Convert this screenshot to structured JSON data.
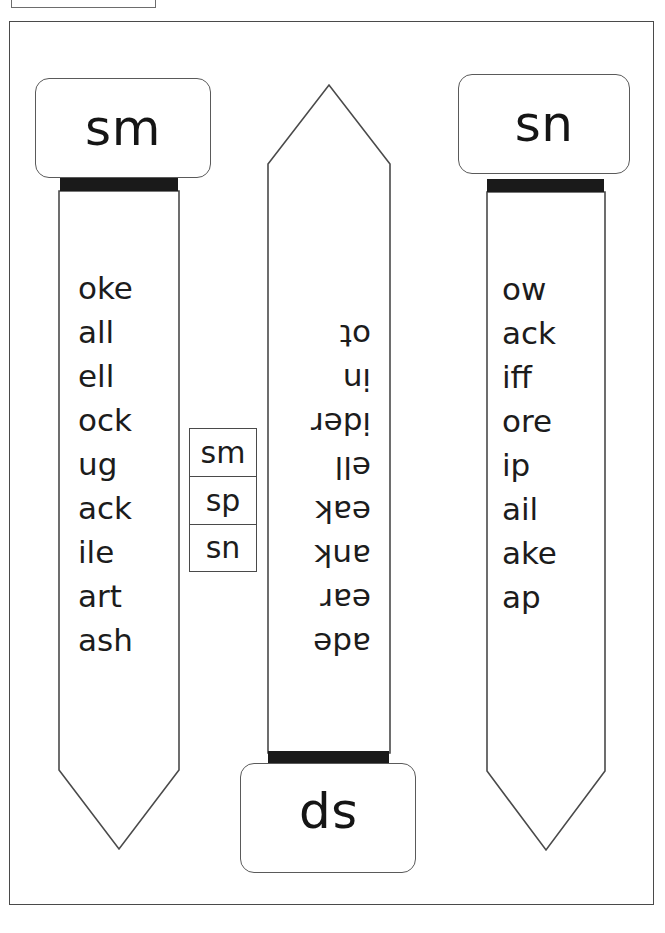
{
  "page": {
    "background_color": "#ffffff",
    "border_color": "#4a4a4a",
    "text_color": "#1c1c1c",
    "bar_color": "#1a1a1a"
  },
  "strips": [
    {
      "id": "sm",
      "label": "sm",
      "orientation": "upright",
      "position": "left",
      "words": [
        "oke",
        "all",
        "ell",
        "ock",
        "ug",
        "ack",
        "ile",
        "art",
        "ash"
      ]
    },
    {
      "id": "sp",
      "label": "sp",
      "orientation": "rotated-180",
      "position": "middle",
      "words": [
        "ade",
        "ear",
        "ank",
        "eak",
        "ell",
        "ider",
        "in",
        "ot"
      ]
    },
    {
      "id": "sn",
      "label": "sn",
      "orientation": "upright",
      "position": "right",
      "words": [
        "ow",
        "ack",
        "iff",
        "ore",
        "ip",
        "ail",
        "ake",
        "ap"
      ]
    }
  ],
  "key_boxes": {
    "items": [
      {
        "label": "sm"
      },
      {
        "label": "sp"
      },
      {
        "label": "sn"
      }
    ]
  }
}
